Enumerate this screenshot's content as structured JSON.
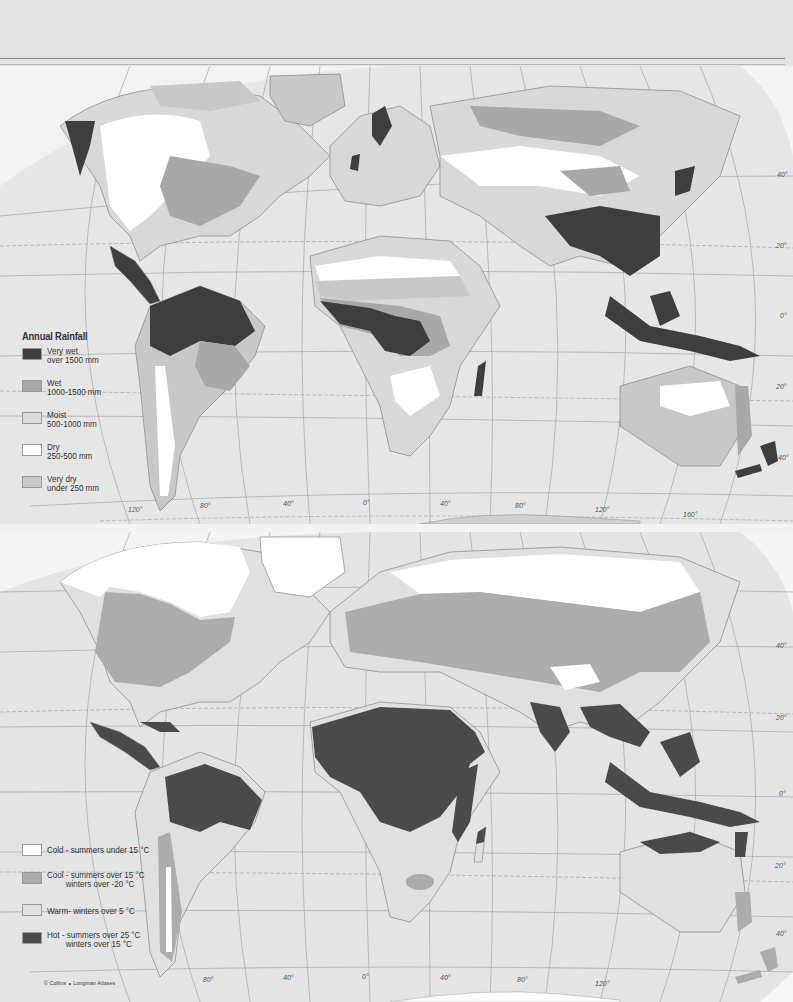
{
  "page": {
    "credit": "© Collins ∘ Longman Atlases"
  },
  "rainfall_map": {
    "legend": {
      "title": "Annual Rainfall",
      "items": [
        {
          "line1": "Very wet",
          "line2": "over 1500 mm",
          "color": "#3e3e3e"
        },
        {
          "line1": "Wet",
          "line2": "1000-1500 mm",
          "color": "#a8a8a8"
        },
        {
          "line1": "Moist",
          "line2": "500-1000 mm",
          "color": "#dcdcdc"
        },
        {
          "line1": "Dry",
          "line2": "250-500 mm",
          "color": "#ffffff"
        },
        {
          "line1": "Very dry",
          "line2": "under 250 mm",
          "color": "#c8c8c8"
        }
      ]
    },
    "longitude_labels": [
      "120°",
      "80°",
      "40°",
      "0°",
      "40°",
      "80°",
      "120°",
      "160°"
    ],
    "latitude_labels": [
      "40°",
      "20°",
      "0°",
      "20°",
      "40°"
    ]
  },
  "temperature_map": {
    "legend": {
      "items": [
        {
          "line1": "Cold - summers under 15 °C",
          "line2": "",
          "color": "#ffffff"
        },
        {
          "line1": "Cool - summers over 15 °C",
          "line2": "winters over -20 °C",
          "color": "#acacac"
        },
        {
          "line1": "Warm- winters over 5 °C",
          "line2": "",
          "color": "#e0e0e0"
        },
        {
          "line1": "Hot - summers over 25 °C",
          "line2": "winters over 15 °C",
          "color": "#4a4a4a"
        }
      ]
    },
    "longitude_labels": [
      "80°",
      "40°",
      "0°",
      "40°",
      "80°",
      "120°"
    ],
    "latitude_labels": [
      "40°",
      "20°",
      "0°",
      "20°",
      "40°"
    ]
  }
}
